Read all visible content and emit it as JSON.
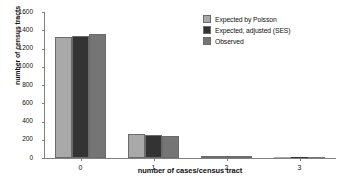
{
  "chart_data": {
    "type": "bar",
    "title": "",
    "xlabel": "number of cases/census tract",
    "ylabel": "number of census tracts",
    "categories": [
      "0",
      "1",
      "2",
      "3"
    ],
    "ylim": [
      0,
      1600
    ],
    "yticks": [
      0,
      200,
      400,
      600,
      800,
      1000,
      1200,
      1400,
      1600
    ],
    "grid": false,
    "legend_position": "top-right",
    "series": [
      {
        "name": "Expected by Poisson",
        "color": "#a9a9a9",
        "values": [
          1330,
          265,
          20,
          1
        ]
      },
      {
        "name": "Expected, adjusted (SES)",
        "color": "#333333",
        "values": [
          1335,
          255,
          22,
          1
        ]
      },
      {
        "name": "Observed",
        "color": "#757575",
        "values": [
          1355,
          243,
          20,
          1
        ]
      }
    ]
  }
}
